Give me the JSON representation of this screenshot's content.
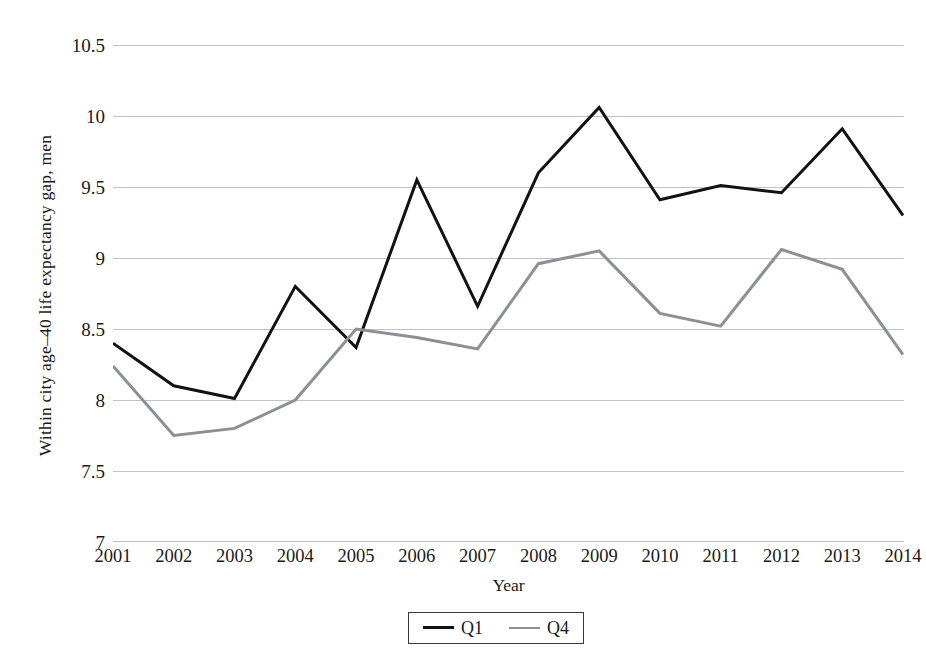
{
  "chart_data": {
    "type": "line",
    "title": "",
    "xlabel": "Year",
    "ylabel": "Within city age–40 life expectancy gap, men",
    "categories": [
      2001,
      2002,
      2003,
      2004,
      2005,
      2006,
      2007,
      2008,
      2009,
      2010,
      2011,
      2012,
      2013,
      2014
    ],
    "xtick_labels": [
      "2001",
      "2002",
      "2003",
      "2004",
      "2005",
      "2006",
      "2007",
      "2008",
      "2009",
      "2010",
      "2011",
      "2012",
      "2013",
      "2014"
    ],
    "ytick_labels": [
      "7",
      "7.5",
      "8",
      "8.5",
      "9",
      "9.5",
      "10",
      "10.5"
    ],
    "ytick_values": [
      7,
      7.5,
      8,
      8.5,
      9,
      9.5,
      10,
      10.5
    ],
    "ylim": [
      7,
      10.5
    ],
    "xlim": [
      2001,
      2014
    ],
    "grid": "horizontal",
    "grid_color": "#b9bcc4",
    "legend_position": "bottom-center",
    "series": [
      {
        "name": "Q1",
        "color": "#121212",
        "width": 3.0,
        "values": [
          8.4,
          8.1,
          8.01,
          8.8,
          8.37,
          9.55,
          8.66,
          9.6,
          10.06,
          9.41,
          9.51,
          9.46,
          9.91,
          9.3
        ]
      },
      {
        "name": "Q4",
        "color": "#8c8f94",
        "width": 3.0,
        "values": [
          8.24,
          7.75,
          7.8,
          8.0,
          8.5,
          8.44,
          8.36,
          8.96,
          9.05,
          8.61,
          8.52,
          9.06,
          8.92,
          8.32
        ]
      }
    ],
    "legend": [
      {
        "label": "Q1",
        "color": "#121212",
        "width": 3.2
      },
      {
        "label": "Q4",
        "color": "#8c8f94",
        "width": 2.4
      }
    ]
  }
}
